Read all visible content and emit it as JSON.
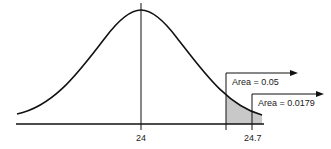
{
  "diagram": {
    "type": "normal-distribution",
    "mean_label": "24",
    "critical_label": "24.7",
    "area_labels": [
      "Area = 0.05",
      "Area = 0.0179"
    ],
    "shade_color": "#c8c8c8",
    "line_color": "#111111"
  }
}
